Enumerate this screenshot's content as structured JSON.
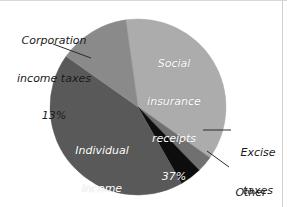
{
  "chart_data": {
    "type": "pie",
    "title": "",
    "subtitle": "",
    "xlabel": "",
    "ylabel": "",
    "legend_position": "none",
    "grid": false,
    "units": "percent",
    "total": 100,
    "start_angle_deg": -8,
    "direction": "clockwise",
    "categories": [
      "Social insurance receipts",
      "Excise taxes",
      "Other",
      "Individual income taxes",
      "Corporation income taxes"
    ],
    "values": [
      37,
      3,
      4,
      43,
      13
    ],
    "slices": [
      {
        "name": "social-insurance-receipts",
        "label": "Social\ninsurance\nreceipts",
        "label_line1": "Social",
        "label_line2": "insurance",
        "label_line3": "receipts",
        "value": 37,
        "value_text": "37%",
        "color": "#ACACAC",
        "label_placement": "inside",
        "text_color": "#FFFFFF"
      },
      {
        "name": "excise-taxes",
        "label": "Excise\ntaxes",
        "label_line1": "Excise",
        "label_line2": "taxes",
        "value": 3,
        "value_text": "3%",
        "color": "#707070",
        "label_placement": "outside",
        "text_color": "#1A1A1A"
      },
      {
        "name": "other",
        "label": "Other",
        "label_line1": "Other",
        "value": 4,
        "value_text": "4%",
        "color": "#0D0D0D",
        "label_placement": "outside",
        "text_color": "#1A1A1A"
      },
      {
        "name": "individual-income-taxes",
        "label": "Individual\nincome\ntaxes",
        "label_line1": "Individual",
        "label_line2": "income",
        "label_line3": "taxes",
        "value": 43,
        "value_text": "43%",
        "color": "#595959",
        "label_placement": "inside",
        "text_color": "#FFFFFF"
      },
      {
        "name": "corporation-income-taxes",
        "label": "Corporation\nincome taxes",
        "label_line1": "Corporation",
        "label_line2": "income taxes",
        "value": 13,
        "value_text": "13%",
        "color": "#8A8A8A",
        "label_placement": "outside",
        "text_color": "#1A1A1A"
      }
    ]
  },
  "figure": {
    "background": "#FFFFFF",
    "border_color": "#D4D4D4",
    "center_x": 138,
    "center_y": 107,
    "radius": 88
  },
  "leaders": [
    {
      "name": "leader-corporation",
      "x1": 53,
      "y1": 44,
      "x2": 91,
      "y2": 58
    },
    {
      "name": "leader-excise",
      "x1": 203,
      "y1": 130,
      "x2": 231,
      "y2": 130
    },
    {
      "name": "leader-other",
      "x1": 207,
      "y1": 151,
      "x2": 229,
      "y2": 167
    }
  ]
}
